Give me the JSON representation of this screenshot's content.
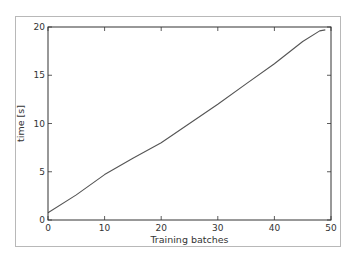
{
  "chart_data": {
    "type": "line",
    "title": "",
    "xlabel": "Training batches",
    "ylabel": "time [s]",
    "xlim": [
      0,
      50
    ],
    "ylim": [
      0,
      20
    ],
    "xticks": [
      0,
      10,
      20,
      30,
      40,
      50
    ],
    "yticks": [
      0,
      5,
      10,
      15,
      20
    ],
    "xtick_labels": [
      "0",
      "10",
      "20",
      "30",
      "40",
      "50"
    ],
    "ytick_labels": [
      "0",
      "5",
      "10",
      "15",
      "20"
    ],
    "grid": false,
    "legend": null,
    "series": [
      {
        "name": "time",
        "color": "#555555",
        "x": [
          0,
          5,
          10,
          15,
          20,
          25,
          30,
          35,
          40,
          45,
          48,
          49
        ],
        "y": [
          0.75,
          2.6,
          4.7,
          6.4,
          8.0,
          10.0,
          12.0,
          14.1,
          16.2,
          18.5,
          19.6,
          19.7
        ]
      }
    ]
  }
}
